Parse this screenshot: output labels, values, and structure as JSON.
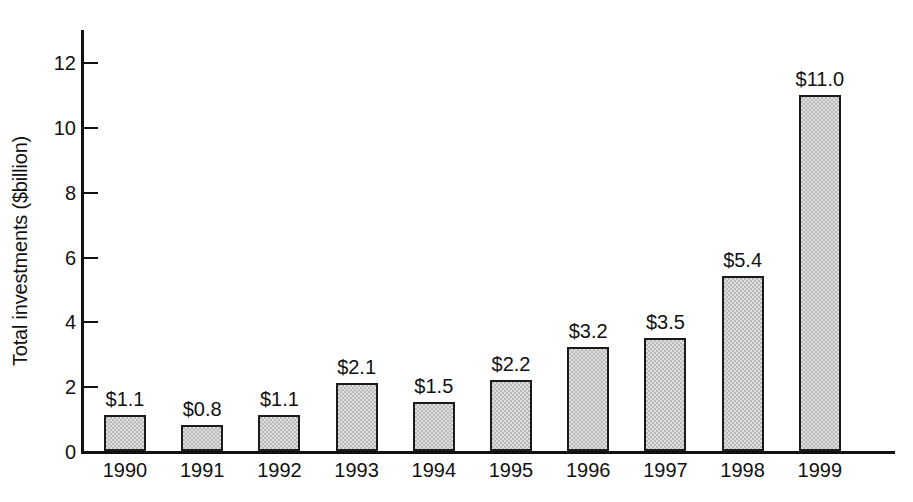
{
  "chart_data": {
    "type": "bar",
    "title": "",
    "subtitle": "",
    "xlabel": "",
    "ylabel": "Total investments ($billion)",
    "categories": [
      "1990",
      "1991",
      "1992",
      "1993",
      "1994",
      "1995",
      "1996",
      "1997",
      "1998",
      "1999"
    ],
    "values": [
      1.1,
      0.8,
      1.1,
      2.1,
      1.5,
      2.2,
      3.2,
      3.5,
      5.4,
      11.0
    ],
    "data_labels": [
      "$1.1",
      "$0.8",
      "$1.1",
      "$2.1",
      "$1.5",
      "$2.2",
      "$3.2",
      "$3.5",
      "$5.4",
      "$11.0"
    ],
    "ylim": [
      0,
      13
    ],
    "y_ticks": [
      0,
      2,
      4,
      6,
      8,
      10,
      12
    ],
    "y_tick_labels": [
      "0",
      "2",
      "4",
      "6",
      "8",
      "10",
      "12"
    ],
    "grid": false,
    "legend": null,
    "legend_position": "none",
    "series": [
      {
        "name": "Total investments",
        "values": [
          1.1,
          0.8,
          1.1,
          2.1,
          1.5,
          2.2,
          3.2,
          3.5,
          5.4,
          11.0
        ]
      }
    ],
    "colors": {
      "bar_fill": "#b9b9b9",
      "bar_border": "#1b1b1b",
      "axis": "#111111",
      "text": "#111111",
      "background": "#ffffff"
    }
  }
}
